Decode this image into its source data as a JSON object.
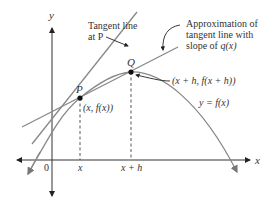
{
  "diagram": {
    "axes": {
      "x_label": "x",
      "y_label": "y",
      "origin_label": "0",
      "tick_labels": [
        "x",
        "x + h"
      ]
    },
    "points": {
      "P": {
        "name": "P",
        "coord_label": "(x, f(x))"
      },
      "Q": {
        "name": "Q",
        "coord_label": "(x + h, f(x + h))"
      }
    },
    "curve_label": "y = f(x)",
    "annotations": {
      "tangent_line_line1": "Tangent line",
      "tangent_line_line2": "at P",
      "approx_line1": "Approximation of",
      "approx_line2": "tangent line with",
      "approx_line3_prefix": "slope of ",
      "approx_line3_fn": "q(x)"
    },
    "colors": {
      "axis": "#333333",
      "curve": "#888888",
      "text": "#333333",
      "point": "#111111"
    }
  }
}
